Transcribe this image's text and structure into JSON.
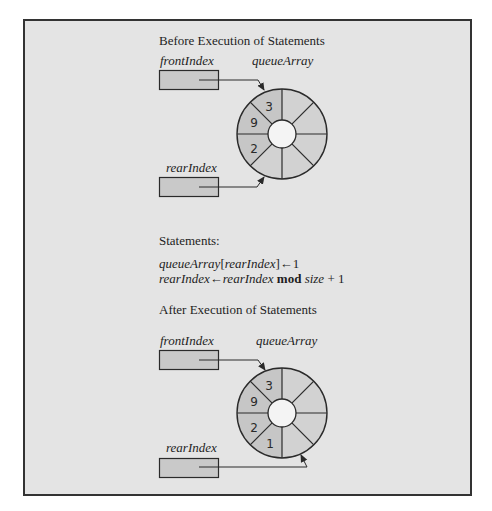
{
  "colors": {
    "background": "#e4e4e4",
    "segment_filled": "#c8c8c8",
    "segment_empty": "#d3d3d3",
    "stroke": "#2a2a2a",
    "frame_border": "#333333"
  },
  "before": {
    "heading": "Before Execution of Statements",
    "front_label": "frontIndex",
    "array_label": "queueArray",
    "rear_label": "rearIndex",
    "ring": {
      "segments": 8,
      "values": [
        "3",
        "9",
        "2",
        "",
        "",
        "",
        "",
        ""
      ],
      "front_points_to": "segment containing 3",
      "rear_points_to": "empty segment after 2"
    }
  },
  "statements": {
    "heading": "Statements:",
    "line1": {
      "array": "queueArray",
      "open": "[",
      "index": "rearIndex",
      "close": "]",
      "arrow": "←",
      "value": "1"
    },
    "line2": {
      "target": "rearIndex",
      "arrow": "←",
      "expr_var": "rearIndex",
      "op": "mod",
      "size": "size",
      "plus": "+ 1"
    }
  },
  "after": {
    "heading": "After Execution of Statements",
    "front_label": "frontIndex",
    "array_label": "queueArray",
    "rear_label": "rearIndex",
    "ring": {
      "segments": 8,
      "values": [
        "3",
        "9",
        "2",
        "1",
        "",
        "",
        "",
        ""
      ],
      "front_points_to": "segment containing 3",
      "rear_points_to": "empty segment after 1"
    }
  }
}
